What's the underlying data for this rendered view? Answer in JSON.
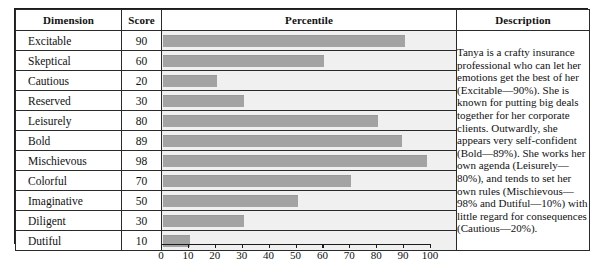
{
  "table": {
    "headers": {
      "dimension": "Dimension",
      "score": "Score",
      "percentile": "Percentile",
      "description": "Description"
    },
    "rows": [
      {
        "dimension": "Excitable",
        "score": 90
      },
      {
        "dimension": "Skeptical",
        "score": 60
      },
      {
        "dimension": "Cautious",
        "score": 20
      },
      {
        "dimension": "Reserved",
        "score": 30
      },
      {
        "dimension": "Leisurely",
        "score": 80
      },
      {
        "dimension": "Bold",
        "score": 89
      },
      {
        "dimension": "Mischievous",
        "score": 98
      },
      {
        "dimension": "Colorful",
        "score": 70
      },
      {
        "dimension": "Imaginative",
        "score": 50
      },
      {
        "dimension": "Diligent",
        "score": 30
      },
      {
        "dimension": "Dutiful",
        "score": 10
      }
    ],
    "description": "Tanya is a crafty insurance professional who can let her emotions get the best of her (Excitable—90%). She is known for putting big deals together for her corporate clients. Outwardly, she appears very self-confident (Bold—89%). She works her own agenda (Leisurely—80%), and tends to set her own rules (Mischievous—98% and Dutiful—10%) with little regard for consequences (Cautious—20%)."
  },
  "colors": {
    "bar": "#a3a3a3",
    "percentile_background": "#f0f0f0",
    "border": "#1c1c1c",
    "text": "#111111",
    "page_background": "#ffffff"
  },
  "chart_data": {
    "type": "bar",
    "orientation": "horizontal",
    "title": "Percentile",
    "xlabel": "",
    "ylabel": "Dimension",
    "xlim": [
      0,
      100
    ],
    "xticks": [
      0,
      10,
      20,
      30,
      40,
      50,
      60,
      70,
      80,
      90,
      100
    ],
    "grid": false,
    "legend": false,
    "categories": [
      "Excitable",
      "Skeptical",
      "Cautious",
      "Reserved",
      "Leisurely",
      "Bold",
      "Mischievous",
      "Colorful",
      "Imaginative",
      "Diligent",
      "Dutiful"
    ],
    "values": [
      90,
      60,
      20,
      30,
      80,
      89,
      98,
      70,
      50,
      30,
      10
    ]
  }
}
